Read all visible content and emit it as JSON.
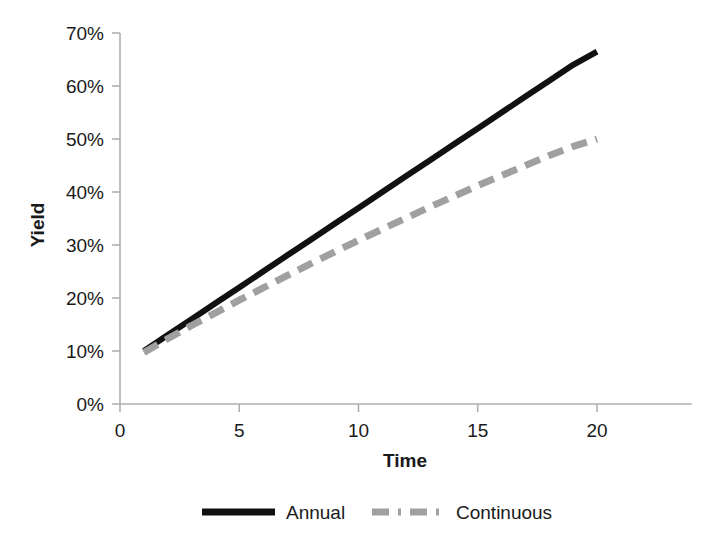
{
  "chart_data": {
    "type": "line",
    "title": "",
    "xlabel": "Time",
    "ylabel": "Yield",
    "xlim": [
      0,
      21
    ],
    "ylim": [
      0,
      0.7
    ],
    "grid": false,
    "legend_position": "bottom",
    "x_tick_labels": [
      "0",
      "5",
      "10",
      "15",
      "20"
    ],
    "x_ticks": [
      0,
      5,
      10,
      15,
      20
    ],
    "y_tick_labels": [
      "0%",
      "10%",
      "20%",
      "30%",
      "40%",
      "50%",
      "60%",
      "70%"
    ],
    "y_ticks": [
      0,
      10,
      20,
      30,
      40,
      50,
      60,
      70
    ],
    "x": [
      1,
      2,
      3,
      4,
      5,
      6,
      7,
      8,
      9,
      10,
      11,
      12,
      13,
      14,
      15,
      16,
      17,
      18,
      19,
      20
    ],
    "series": [
      {
        "name": "Annual",
        "style": "solid",
        "color": "#111111",
        "values": [
          10.0,
          13.0,
          16.0,
          19.0,
          22.0,
          25.0,
          28.0,
          31.0,
          34.0,
          37.0,
          40.0,
          43.0,
          46.0,
          49.0,
          52.0,
          55.0,
          58.0,
          61.0,
          64.0,
          66.5
        ]
      },
      {
        "name": "Continuous",
        "style": "dashed",
        "color": "#a0a0a0",
        "values": [
          9.7,
          12.3,
          14.8,
          17.2,
          19.6,
          21.9,
          24.2,
          26.5,
          28.7,
          30.9,
          33.0,
          35.1,
          37.2,
          39.2,
          41.2,
          43.1,
          45.0,
          46.9,
          48.6,
          50.0
        ]
      }
    ]
  },
  "legend": {
    "items": [
      {
        "label": "Annual"
      },
      {
        "label": "Continuous"
      }
    ]
  },
  "axes": {
    "y_title": "Yield",
    "x_title": "Time"
  },
  "colors": {
    "annual": "#111111",
    "continuous": "#a0a0a0",
    "axis": "#b0b0b0",
    "text": "#1a1a1a",
    "background": "#ffffff"
  }
}
